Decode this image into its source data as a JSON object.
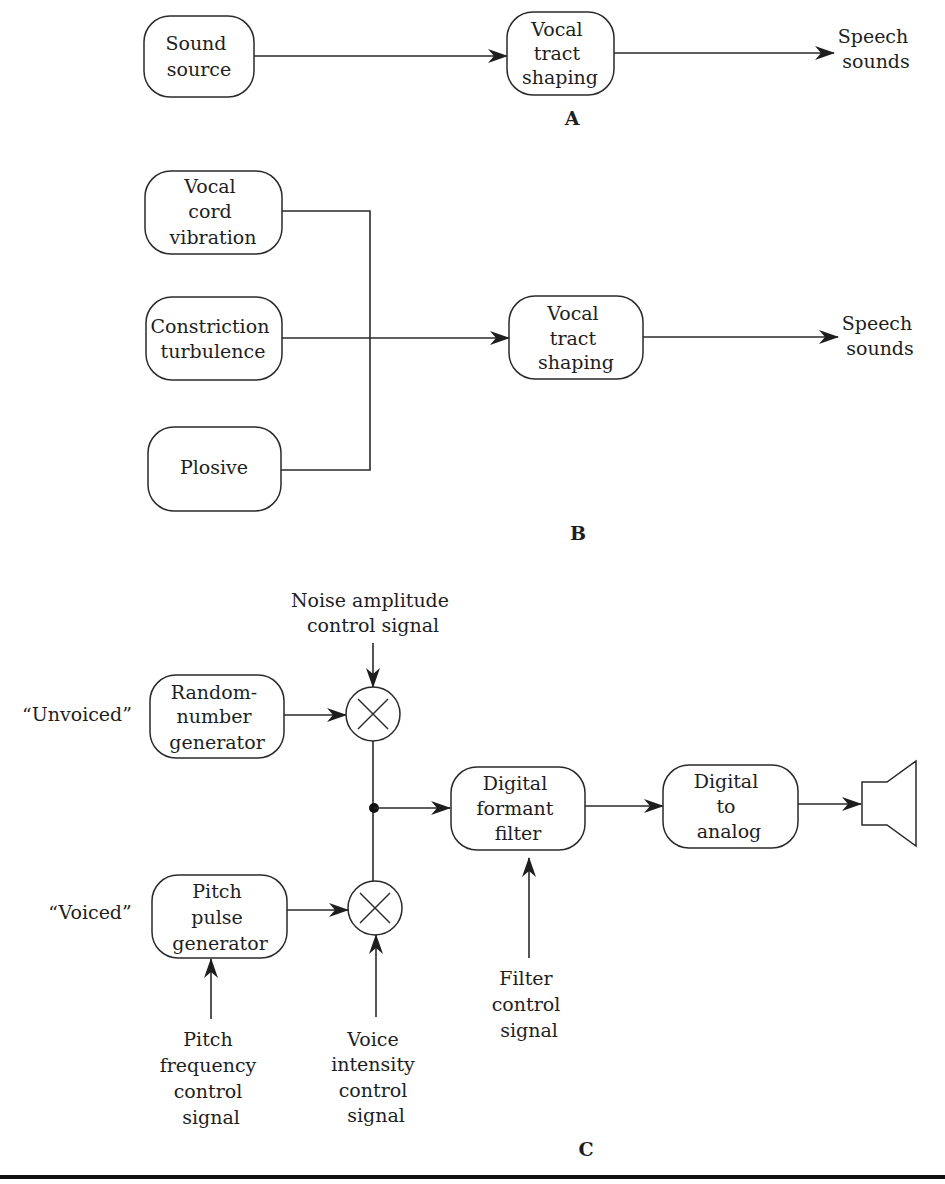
{
  "diagram": {
    "section_a": {
      "label": "A",
      "nodes": {
        "sound_source": [
          "Sound",
          "source"
        ],
        "vocal_tract": [
          "Vocal",
          "tract",
          "shaping"
        ],
        "output": [
          "Speech",
          "sounds"
        ]
      }
    },
    "section_b": {
      "label": "B",
      "nodes": {
        "vocal_cord": [
          "Vocal",
          "cord",
          "vibration"
        ],
        "constriction": [
          "Constriction",
          "turbulence"
        ],
        "plosive": [
          "Plosive"
        ],
        "vocal_tract": [
          "Vocal",
          "tract",
          "shaping"
        ],
        "output": [
          "Speech",
          "sounds"
        ]
      }
    },
    "section_c": {
      "label": "C",
      "unvoiced_label": "“Unvoiced”",
      "voiced_label": "“Voiced”",
      "nodes": {
        "random_gen": [
          "Random-",
          "number",
          "generator"
        ],
        "pitch_gen": [
          "Pitch",
          "pulse",
          "generator"
        ],
        "formant_filter": [
          "Digital",
          "formant",
          "filter"
        ],
        "dac": [
          "Digital",
          "to",
          "analog"
        ]
      },
      "signals": {
        "noise_amp": [
          "Noise amplitude",
          "control signal"
        ],
        "pitch_freq": [
          "Pitch",
          "frequency",
          "control",
          "signal"
        ],
        "voice_intensity": [
          "Voice",
          "intensity",
          "control",
          "signal"
        ],
        "filter_control": [
          "Filter",
          "control",
          "signal"
        ]
      },
      "icons": {
        "multiplier": "multiply-icon",
        "output": "speaker-icon"
      }
    }
  }
}
